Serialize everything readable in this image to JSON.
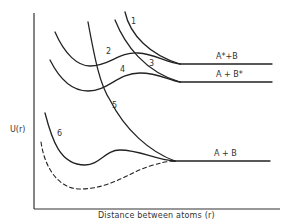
{
  "diagram": {
    "type": "potential-energy-curves",
    "y_axis_label": "U(r)",
    "x_axis_label": "Distance between atoms (r)",
    "asymptotes": [
      {
        "label": "A*+B",
        "y": 64
      },
      {
        "label": "A + B*",
        "y": 82
      },
      {
        "label": "A + B",
        "y": 161
      }
    ],
    "curves": [
      {
        "id": "1",
        "label": "1",
        "style": "solid"
      },
      {
        "id": "2",
        "label": "2",
        "style": "solid"
      },
      {
        "id": "3",
        "label": "3",
        "style": "solid"
      },
      {
        "id": "4",
        "label": "4",
        "style": "solid"
      },
      {
        "id": "5",
        "label": "5",
        "style": "solid"
      },
      {
        "id": "6",
        "label": "6",
        "style": "solid"
      },
      {
        "id": "ground-dashed",
        "label": "",
        "style": "dashed"
      }
    ],
    "colors": {
      "line": "#222222",
      "background": "#ffffff"
    }
  }
}
